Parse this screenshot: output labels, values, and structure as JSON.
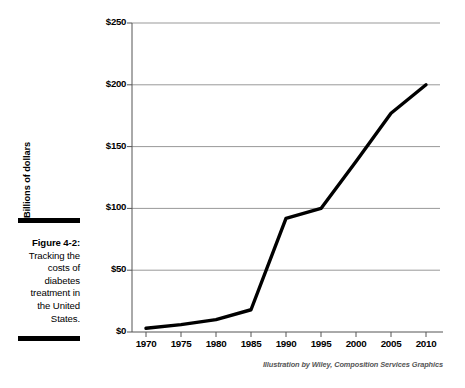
{
  "figure": {
    "label": "Figure 4-2:",
    "caption": "Tracking the costs of diabetes treatment in the United States.",
    "rule_color": "#000000"
  },
  "attribution": "Illustration by Wiley, Composition Services Graphics",
  "colors": {
    "line": "#000000",
    "gridline": "#999999",
    "axis": "#555555",
    "text": "#000000",
    "attribution_text": "#555555",
    "background": "#ffffff"
  },
  "chart_data": {
    "type": "line",
    "title": "",
    "xlabel": "",
    "ylabel": "Billions of dollars",
    "xlim": [
      1968,
      2012
    ],
    "ylim": [
      0,
      250
    ],
    "ytick_labels": [
      "$250",
      "$200",
      "$150",
      "$100",
      "$50",
      "$0"
    ],
    "ytick_values": [
      250,
      200,
      150,
      100,
      50,
      0
    ],
    "xtick_labels": [
      "1970",
      "1975",
      "1980",
      "1985",
      "1990",
      "1995",
      "2000",
      "2005",
      "2010"
    ],
    "xtick_values": [
      1970,
      1975,
      1980,
      1985,
      1990,
      1995,
      2000,
      2005,
      2010
    ],
    "grid": true,
    "grid_axis": "y",
    "legend": false,
    "series": [
      {
        "name": "Cost of diabetes treatment",
        "x": [
          1970,
          1975,
          1980,
          1985,
          1990,
          1995,
          2000,
          2005,
          2010
        ],
        "values": [
          3,
          6,
          10,
          18,
          92,
          100,
          138,
          177,
          200
        ]
      }
    ]
  }
}
